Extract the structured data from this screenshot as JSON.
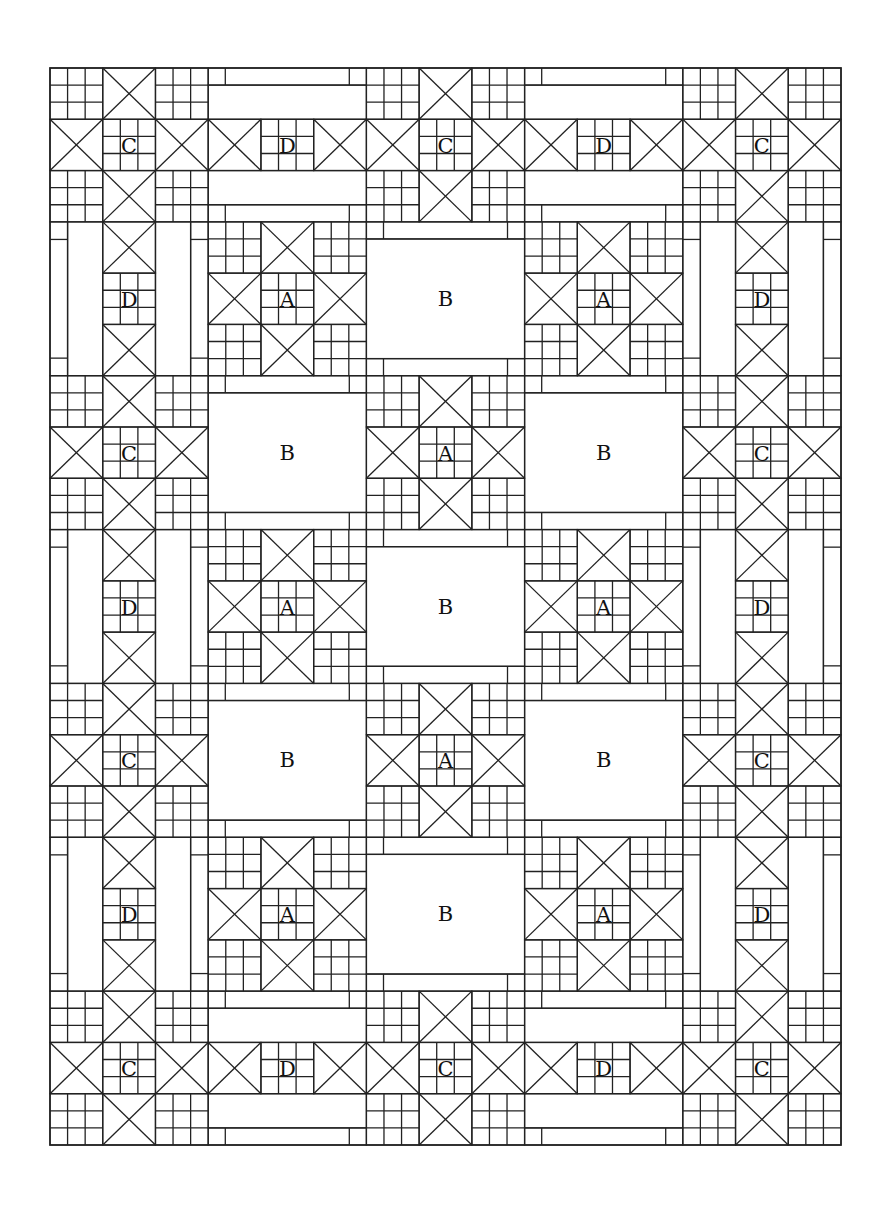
{
  "diagram": {
    "type": "quilt-layout",
    "frame": {
      "x": 50,
      "y": 68,
      "width": 791,
      "height": 1077
    },
    "grid": {
      "cols": 5,
      "rows": 7
    },
    "line_color": "#222222",
    "background": "#ffffff",
    "blocks": [
      [
        "C",
        "D-h",
        "C",
        "D-h",
        "C"
      ],
      [
        "D-v",
        "A",
        "B",
        "A",
        "D-v"
      ],
      [
        "C",
        "B",
        "A",
        "B",
        "C"
      ],
      [
        "D-v",
        "A",
        "B",
        "A",
        "D-v"
      ],
      [
        "C",
        "B",
        "A",
        "B",
        "C"
      ],
      [
        "D-v",
        "A",
        "B",
        "A",
        "D-v"
      ],
      [
        "C",
        "D-h",
        "C",
        "D-h",
        "C"
      ]
    ],
    "labels": {
      "A": "A",
      "B": "B",
      "C": "C",
      "D": "D"
    },
    "legend_counts": {
      "A": 7,
      "B": 6,
      "C": 10,
      "D": 10
    }
  }
}
